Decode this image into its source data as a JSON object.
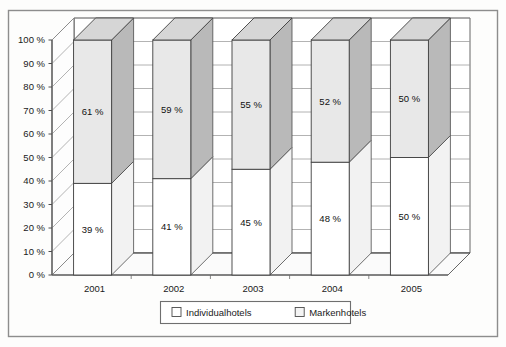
{
  "chart_data": {
    "type": "bar",
    "subtype": "100-percent-stacked-3d-column",
    "title": "",
    "subtitle": "",
    "xlabel": "",
    "ylabel": "",
    "categories": [
      "2001",
      "2002",
      "2003",
      "2004",
      "2005"
    ],
    "series": [
      {
        "name": "Individualhotels",
        "values": [
          39,
          41,
          45,
          48,
          50
        ],
        "value_labels": [
          "39 %",
          "41 %",
          "45 %",
          "48 %",
          "50 %"
        ],
        "color": "#ffffff",
        "side_color": "#f2f2f2",
        "top_color": "#ebebeb"
      },
      {
        "name": "Markenhotels",
        "values": [
          61,
          59,
          55,
          52,
          50
        ],
        "value_labels": [
          "61 %",
          "59 %",
          "55 %",
          "52 %",
          "50 %"
        ],
        "color": "#e8e8e8",
        "side_color": "#b9b9b9",
        "top_color": "#d6d6d6"
      }
    ],
    "ylim": [
      0,
      100
    ],
    "ytick_values": [
      0,
      10,
      20,
      30,
      40,
      50,
      60,
      70,
      80,
      90,
      100
    ],
    "ytick_labels": [
      "0 %",
      "10 %",
      "20 %",
      "30 %",
      "40 %",
      "50 %",
      "60 %",
      "70 %",
      "80 %",
      "90 %",
      "100 %"
    ],
    "grid": true,
    "legend_position": "bottom",
    "legend_entries": [
      "Individualhotels",
      "Markenhotels"
    ],
    "units": "percent",
    "stack_total": 100
  },
  "figure": {
    "background_color": "#fdfdfc",
    "border_color": "#8a8a8a",
    "plot_line_color": "#555555",
    "grid_color": "#9a9a9a"
  },
  "legend": {
    "items": [
      {
        "label": "Individualhotels",
        "swatch_color": "#ffffff"
      },
      {
        "label": "Markenhotels",
        "swatch_color": "#f4f4f4"
      }
    ]
  }
}
